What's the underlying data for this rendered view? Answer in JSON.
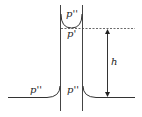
{
  "diagram": {
    "labels": {
      "inside_top": "p''",
      "below_meniscus": "p'",
      "outside_left": "p''",
      "inside_bottom": "p''",
      "height": "h"
    },
    "colors": {
      "line": "#333333",
      "background": "#ffffff"
    }
  }
}
